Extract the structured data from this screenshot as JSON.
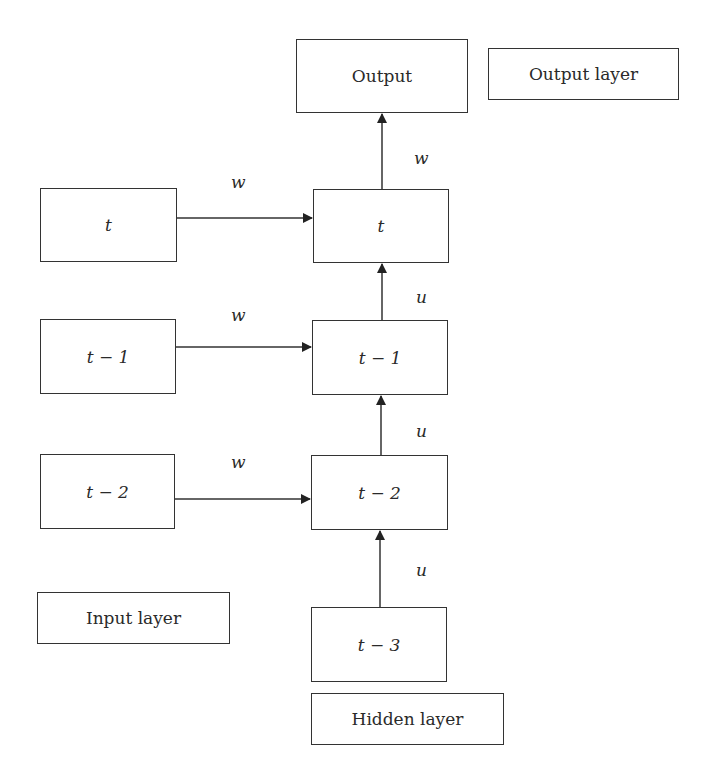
{
  "diagram": {
    "output_node": {
      "label": "Output"
    },
    "legends": {
      "output_layer": "Output layer",
      "input_layer": "Input layer",
      "hidden_layer": "Hidden layer"
    },
    "input_nodes": [
      {
        "label": "t"
      },
      {
        "label": "t − 1"
      },
      {
        "label": "t − 2"
      }
    ],
    "hidden_nodes": [
      {
        "label": "t"
      },
      {
        "label": "t − 1"
      },
      {
        "label": "t − 2"
      },
      {
        "label": "t − 3"
      }
    ],
    "edges": {
      "input_weights": [
        "w",
        "w",
        "w"
      ],
      "hidden_to_output": "w",
      "recurrent_weights": [
        "u",
        "u",
        "u"
      ]
    }
  }
}
